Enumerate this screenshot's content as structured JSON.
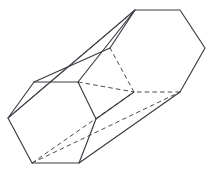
{
  "figure": {
    "shape_name": "hexagonal-prism",
    "projection": "oblique",
    "background_color": "#ffffff",
    "solid_edge_color": "#3a3a42",
    "hidden_edge_color": "#4a4a52",
    "solid_edge_width": 1.15,
    "hidden_edge_width": 1.0,
    "hidden_edge_dash": "4.5 3.2",
    "canvas": {
      "width": 214,
      "height": 178
    },
    "vertices": {
      "front_top_left": {
        "x": 34,
        "y": 82
      },
      "front_top_right": {
        "x": 78,
        "y": 82
      },
      "front_right": {
        "x": 96,
        "y": 119
      },
      "front_bottom_right": {
        "x": 79,
        "y": 163
      },
      "front_bottom_left": {
        "x": 32,
        "y": 163
      },
      "front_left": {
        "x": 8,
        "y": 118
      },
      "back_top_left": {
        "x": 135,
        "y": 10
      },
      "back_top_right": {
        "x": 180,
        "y": 10
      },
      "back_right": {
        "x": 205,
        "y": 48
      },
      "back_bottom_right": {
        "x": 180,
        "y": 92
      },
      "back_bottom_left": {
        "x": 134,
        "y": 92
      },
      "back_left": {
        "x": 110,
        "y": 48
      }
    },
    "solid_edges": [
      [
        "front_top_left",
        "front_top_right"
      ],
      [
        "front_top_right",
        "front_right"
      ],
      [
        "front_right",
        "front_bottom_right"
      ],
      [
        "front_bottom_right",
        "front_bottom_left"
      ],
      [
        "front_bottom_left",
        "front_left"
      ],
      [
        "front_left",
        "front_top_left"
      ],
      [
        "back_top_left",
        "back_top_right"
      ],
      [
        "back_top_right",
        "back_right"
      ],
      [
        "back_right",
        "back_bottom_right"
      ],
      [
        "back_bottom_left",
        "back_left"
      ],
      [
        "back_left",
        "back_top_left"
      ],
      [
        "front_top_left",
        "back_left"
      ],
      [
        "front_top_right",
        "back_top_left"
      ],
      [
        "front_right",
        "back_bottom_left"
      ],
      [
        "front_bottom_right",
        "back_bottom_right"
      ],
      [
        "front_left",
        "back_top_left"
      ]
    ],
    "hidden_edges": [
      [
        "back_bottom_right",
        "back_bottom_left"
      ],
      [
        "back_bottom_left",
        "back_top_left"
      ],
      [
        "front_left",
        "back_top_left"
      ],
      [
        "front_bottom_left",
        "back_bottom_left"
      ],
      [
        "front_bottom_left",
        "back_bottom_right"
      ],
      [
        "front_top_right",
        "back_bottom_left"
      ]
    ],
    "faces": [
      {
        "name": "front-hexagon-face",
        "visible": true
      },
      {
        "name": "back-hexagon-face",
        "visible": false
      },
      {
        "name": "top-rectangular-face",
        "visible": true
      },
      {
        "name": "upper-right-rectangular-face",
        "visible": true
      },
      {
        "name": "lower-right-rectangular-face",
        "visible": true
      }
    ]
  }
}
